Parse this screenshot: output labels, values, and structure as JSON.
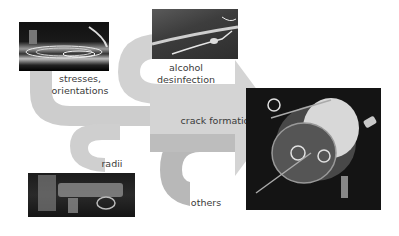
{
  "diagram": {
    "colors": {
      "band": "#cfcfcf",
      "band_dark": "#b9b9b9",
      "background": "#ffffff",
      "text": "#3a3a3a"
    },
    "target": {
      "label": "crack formation"
    },
    "factors": [
      {
        "id": "stresses",
        "label_line1": "stresses,",
        "label_line2": "orientations"
      },
      {
        "id": "alcohol",
        "label_line1": "alcohol",
        "label_line2": "desinfection"
      },
      {
        "id": "radii",
        "label_line1": "radii"
      },
      {
        "id": "others",
        "label_line1": "others"
      }
    ],
    "images": [
      {
        "id": "stress-photo",
        "description": "polariscope stress pattern image"
      },
      {
        "id": "alcohol-photo",
        "description": "cracked tube surface image"
      },
      {
        "id": "radii-photo",
        "description": "plastic connector parts image"
      },
      {
        "id": "device-photo",
        "description": "transparent medical device with highlighted regions"
      }
    ]
  }
}
